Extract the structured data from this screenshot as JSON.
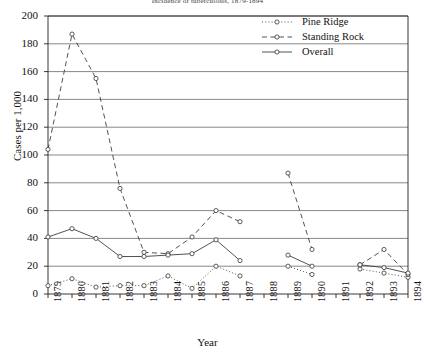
{
  "chart_data": {
    "type": "line",
    "title": "Incidence of tuberculosis, 1879-1894",
    "xlabel": "Year",
    "ylabel": "Cases per 1,000",
    "grid": true,
    "legend_position": "top-right",
    "xlim": [
      1879,
      1894
    ],
    "ylim": [
      0,
      200
    ],
    "yticks": [
      0,
      20,
      40,
      60,
      80,
      100,
      120,
      140,
      160,
      180,
      200
    ],
    "categories": [
      "1879",
      "1880",
      "1881",
      "1882",
      "1883",
      "1884",
      "1885",
      "1886",
      "1887",
      "1888",
      "1889",
      "1890",
      "1891",
      "1892",
      "1893",
      "1894"
    ],
    "series": [
      {
        "name": "Pine Ridge",
        "style": "dotted",
        "marker": "open-circle",
        "values": [
          6,
          11,
          5,
          6,
          6,
          13,
          4,
          20,
          13,
          null,
          20,
          14,
          null,
          18,
          15,
          12
        ]
      },
      {
        "name": "Standing Rock",
        "style": "dashed",
        "marker": "open-circle",
        "values": [
          104,
          187,
          155,
          76,
          30,
          29,
          41,
          60,
          52,
          null,
          87,
          32,
          null,
          21,
          32,
          14
        ]
      },
      {
        "name": "Overall",
        "style": "solid",
        "marker": "open-circle",
        "values": [
          41,
          47,
          40,
          27,
          27,
          28,
          29,
          39,
          24,
          null,
          28,
          20,
          null,
          21,
          19,
          15
        ]
      }
    ]
  },
  "legend": {
    "items": [
      {
        "label": "Pine Ridge"
      },
      {
        "label": "Standing Rock"
      },
      {
        "label": "Overall"
      }
    ]
  }
}
